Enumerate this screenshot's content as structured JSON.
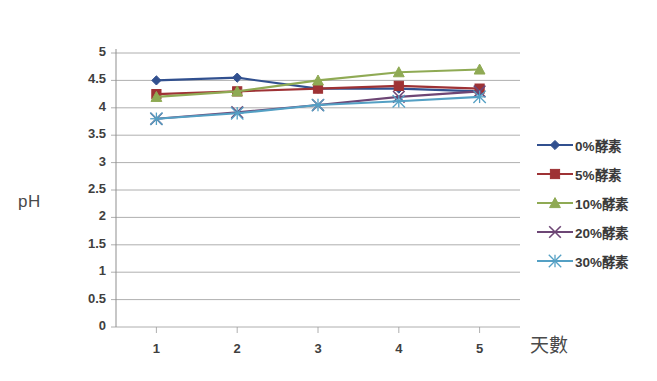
{
  "axis": {
    "y_title": "pH",
    "x_title": "天數",
    "y_ticks": [
      "5",
      "4.5",
      "4",
      "3.5",
      "3",
      "2.5",
      "2",
      "1.5",
      "1",
      "0.5",
      "0"
    ],
    "x_ticks": [
      "1",
      "2",
      "3",
      "4",
      "5"
    ]
  },
  "legend": {
    "items": [
      {
        "label": "0%酵素",
        "color": "#31508f",
        "marker": "diamond"
      },
      {
        "label": "5%酵素",
        "color": "#9e3235",
        "marker": "square"
      },
      {
        "label": "10%酵素",
        "color": "#89a martial",
        "marker": "triangle"
      },
      {
        "label": "20%酵素",
        "color": "#6d4675",
        "marker": "cross"
      },
      {
        "label": "30%酵素",
        "color": "#54a0c4",
        "marker": "asterisk"
      }
    ]
  },
  "chart_data": {
    "type": "line",
    "title": "",
    "xlabel": "天數",
    "ylabel": "pH",
    "categories": [
      "1",
      "2",
      "3",
      "4",
      "5"
    ],
    "x": [
      1,
      2,
      3,
      4,
      5
    ],
    "ylim": [
      0,
      5
    ],
    "xlim": [
      0.5,
      5.5
    ],
    "ytick_step": 0.5,
    "grid": true,
    "legend_position": "right",
    "series": [
      {
        "name": "0%酵素",
        "color": "#31508f",
        "marker": "diamond",
        "values": [
          4.5,
          4.55,
          4.35,
          4.35,
          4.3
        ]
      },
      {
        "name": "5%酵素",
        "color": "#9e3235",
        "marker": "square",
        "values": [
          4.25,
          4.3,
          4.35,
          4.4,
          4.35
        ]
      },
      {
        "name": "10%酵素",
        "color": "#8faa54",
        "marker": "triangle",
        "values": [
          4.2,
          4.3,
          4.5,
          4.65,
          4.7
        ]
      },
      {
        "name": "20%酵素",
        "color": "#6d4675",
        "marker": "cross",
        "values": [
          3.8,
          3.92,
          4.05,
          4.2,
          4.3
        ]
      },
      {
        "name": "30%酵素",
        "color": "#54a0c4",
        "marker": "asterisk",
        "values": [
          3.8,
          3.9,
          4.05,
          4.12,
          4.2
        ]
      }
    ]
  }
}
